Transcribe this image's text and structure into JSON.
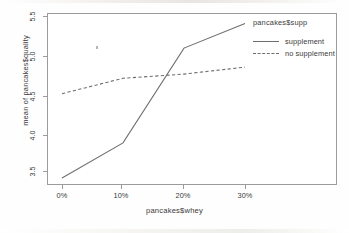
{
  "chart_data": {
    "type": "line",
    "title": "",
    "xlabel": "pancakes$whey",
    "ylabel": "mean of  pancakes$quality",
    "categories": [
      "0%",
      "10%",
      "20%",
      "30%"
    ],
    "x_values": [
      0,
      10,
      20,
      30
    ],
    "xtick_labels": [
      "0%",
      "10%",
      "20%",
      "30%"
    ],
    "ytick_labels": [
      "3.5",
      "4.0",
      "4.5",
      "5.0",
      "5.5"
    ],
    "ytick_values": [
      3.5,
      4.0,
      4.5,
      5.0,
      5.5
    ],
    "ylim": [
      3.1,
      5.55
    ],
    "grid": false,
    "legend_position": "right-top",
    "legend_title": "pancakes$supp",
    "series": [
      {
        "name": "supplement",
        "linestyle": "solid",
        "color": "#6e6e6e",
        "values": [
          3.2,
          3.7,
          5.05,
          5.4
        ]
      },
      {
        "name": "no supplement",
        "linestyle": "dashed",
        "color": "#6e6e6e",
        "values": [
          4.4,
          4.62,
          4.68,
          4.78
        ]
      }
    ]
  },
  "axes": {
    "y_title": "mean of  pancakes$quality",
    "x_title": "pancakes$whey",
    "yticks": [
      {
        "label": "5.5"
      },
      {
        "label": "5.0"
      },
      {
        "label": "4.5"
      },
      {
        "label": "4.0"
      },
      {
        "label": "3.5"
      }
    ],
    "xticks": [
      {
        "label": "0%"
      },
      {
        "label": "10%"
      },
      {
        "label": "20%"
      },
      {
        "label": "30%"
      }
    ]
  },
  "legend": {
    "title": "pancakes$supp",
    "items": [
      {
        "label": "supplement",
        "style": "solid"
      },
      {
        "label": "no supplement",
        "style": "dashed"
      }
    ]
  },
  "caption": ""
}
